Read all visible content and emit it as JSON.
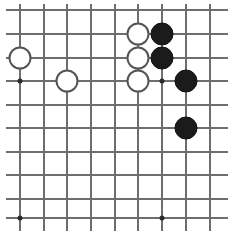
{
  "board": {
    "kind": "go-board-diagram",
    "background_color": "#ffffff",
    "line_color": "#6e6e6e",
    "line_width": 2,
    "star_point_color": "#2b2b2b",
    "star_point_size": 5,
    "stone_diameter": 23,
    "black_stone_color": "#1b1b1b",
    "white_stone_fill": "#ffffff",
    "white_stone_border": "#555555",
    "vertical_lines_x": [
      20,
      44,
      67,
      91,
      115,
      138,
      162,
      186,
      210
    ],
    "horizontal_lines_y": [
      10,
      34,
      58,
      81,
      105,
      128,
      152,
      175,
      199,
      218
    ],
    "grid_left": 6,
    "grid_right": 228,
    "grid_top": 4,
    "grid_bottom": 231,
    "star_points": [
      {
        "x": 20,
        "y": 81
      },
      {
        "x": 162,
        "y": 81
      },
      {
        "x": 20,
        "y": 218
      },
      {
        "x": 162,
        "y": 218
      }
    ],
    "stones": [
      {
        "color": "white",
        "x": 20,
        "y": 58,
        "label": "white-stone-left-upper"
      },
      {
        "color": "white",
        "x": 67,
        "y": 81,
        "label": "white-stone-left-lower"
      },
      {
        "color": "white",
        "x": 138,
        "y": 34,
        "label": "white-stone-cluster-top"
      },
      {
        "color": "white",
        "x": 138,
        "y": 58,
        "label": "white-stone-cluster-middle"
      },
      {
        "color": "white",
        "x": 138,
        "y": 81,
        "label": "white-stone-cluster-bottom"
      },
      {
        "color": "black",
        "x": 162,
        "y": 34,
        "label": "black-stone-cluster-top"
      },
      {
        "color": "black",
        "x": 162,
        "y": 58,
        "label": "black-stone-cluster-middle"
      },
      {
        "color": "black",
        "x": 186,
        "y": 81,
        "label": "black-stone-right-upper"
      },
      {
        "color": "black",
        "x": 186,
        "y": 128,
        "label": "black-stone-right-lower"
      }
    ],
    "counts": {
      "black_stones": 4,
      "white_stones": 5,
      "total_stones": 9
    }
  }
}
